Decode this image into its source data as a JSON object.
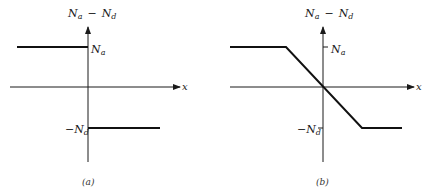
{
  "panels": [
    {
      "id": "a",
      "caption": "(a)",
      "y_axis_label": "Nₐ − Nᵈ",
      "y_label_main": "N",
      "y_label_sub_a": "a",
      "y_label_minus": "−",
      "y_label_sub_d": "d",
      "x_axis_label": "x",
      "upper_level_label": "N",
      "upper_level_sub": "a",
      "lower_level_label": "−N",
      "lower_level_sub": "d",
      "profile": "abrupt step: N_a for x < 0, −N_d for x > 0"
    },
    {
      "id": "b",
      "caption": "(b)",
      "y_axis_label": "Nₐ − Nᵈ",
      "y_label_main": "N",
      "y_label_sub_a": "a",
      "y_label_minus": "−",
      "y_label_sub_d": "d",
      "x_axis_label": "x",
      "upper_level_label": "N",
      "upper_level_sub": "a",
      "lower_level_label": "−N",
      "lower_level_sub": "d",
      "profile": "linearly graded: N_a plateau, linear transition through origin, −N_d plateau"
    }
  ]
}
